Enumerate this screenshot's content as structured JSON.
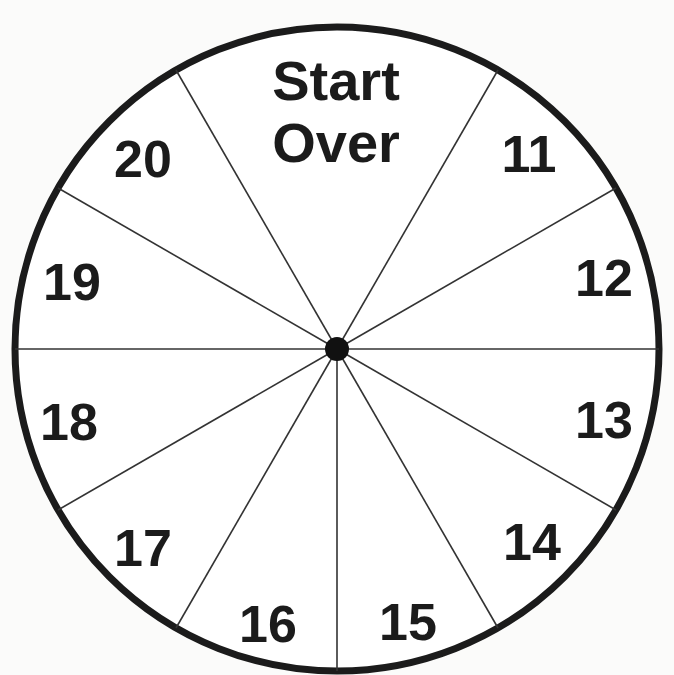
{
  "wheel": {
    "center": [
      337,
      349
    ],
    "radius": 324,
    "stroke_color": "#1b1b1b",
    "background": "#fbfbfa",
    "top_label_line1": "Start",
    "top_label_line2": "Over",
    "segments": [
      {
        "label": "11"
      },
      {
        "label": "12"
      },
      {
        "label": "13"
      },
      {
        "label": "14"
      },
      {
        "label": "15"
      },
      {
        "label": "16"
      },
      {
        "label": "17"
      },
      {
        "label": "18"
      },
      {
        "label": "19"
      },
      {
        "label": "20"
      }
    ]
  }
}
